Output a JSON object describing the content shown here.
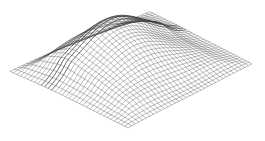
{
  "figure": {
    "type": "wireframe-surface",
    "background": "#ffffff",
    "line_color": "#3a3a3a",
    "grid": {
      "rows": 34,
      "cols": 34
    },
    "corners": {
      "left": [
        10,
        72
      ],
      "back": [
        150,
        12
      ],
      "right": [
        252,
        64
      ],
      "front": [
        128,
        128
      ]
    },
    "peak": {
      "u": 0.42,
      "v": 0.4,
      "height": 34,
      "sigma": 0.28
    },
    "ridge": {
      "height": 10,
      "sigma": 0.07,
      "v": 0.3
    }
  }
}
